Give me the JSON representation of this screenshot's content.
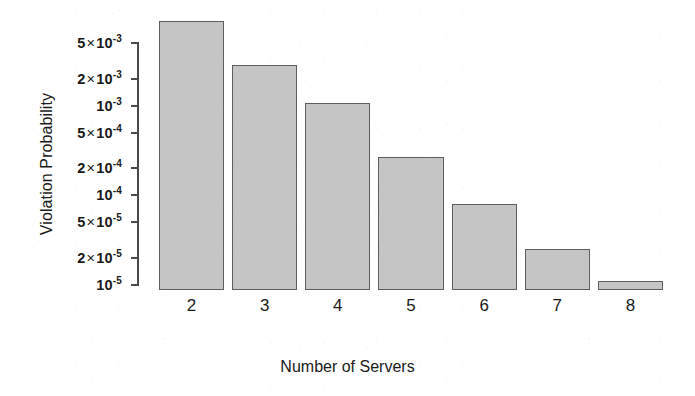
{
  "chart_data": {
    "type": "bar",
    "title": "",
    "xlabel": "Number of Servers",
    "ylabel": "Violation Probability",
    "categories": [
      "2",
      "3",
      "4",
      "5",
      "6",
      "7",
      "8"
    ],
    "values": [
      0.0088,
      0.00285,
      0.00107,
      0.00027,
      8e-05,
      2.5e-05,
      1.1e-05
    ],
    "yscale": "log",
    "ylim": [
      1e-05,
      0.01
    ],
    "grid": false,
    "legend": null,
    "y_ticks": [
      {
        "value": 0.005,
        "mantissa": "5",
        "exponent": "-3",
        "text": "5 × 10⁻³"
      },
      {
        "value": 0.002,
        "mantissa": "2",
        "exponent": "-3",
        "text": "2 × 10⁻³"
      },
      {
        "value": 0.001,
        "mantissa": "",
        "exponent": "-3",
        "text": "10⁻³"
      },
      {
        "value": 0.0005,
        "mantissa": "5",
        "exponent": "-4",
        "text": "5 × 10⁻⁴"
      },
      {
        "value": 0.0002,
        "mantissa": "2",
        "exponent": "-4",
        "text": "2 × 10⁻⁴"
      },
      {
        "value": 0.0001,
        "mantissa": "",
        "exponent": "-4",
        "text": "10⁻⁴"
      },
      {
        "value": 5e-05,
        "mantissa": "5",
        "exponent": "-5",
        "text": "5 × 10⁻⁵"
      },
      {
        "value": 2e-05,
        "mantissa": "2",
        "exponent": "-5",
        "text": "2 × 10⁻⁵"
      },
      {
        "value": 1e-05,
        "mantissa": "",
        "exponent": "-5",
        "text": "10⁻⁵"
      }
    ],
    "colors": {
      "bar_fill": "#c5c5c5",
      "bar_edge": "#5d5d5d",
      "axis": "#4a4a4a",
      "text": "#1a1a1a",
      "background": "#ffffff"
    }
  }
}
